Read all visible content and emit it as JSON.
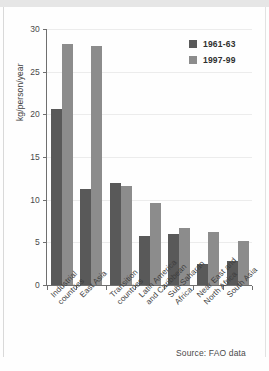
{
  "figure": {
    "source_note": "Source: FAO data",
    "background_color": "#fefefe"
  },
  "legend": {
    "position": "top-right",
    "entries": [
      {
        "label": "1961-63",
        "color": "#595959",
        "swatch_name": "legend-swatch-1961-63"
      },
      {
        "label": "1997-99",
        "color": "#8c8c8c",
        "swatch_name": "legend-swatch-1997-99"
      }
    ]
  },
  "axes": {
    "y_title": "kg/person/year",
    "y_ticks": [
      "0",
      "5",
      "10",
      "15",
      "20",
      "25",
      "30"
    ],
    "x_labels": [
      "Industrial\ncountries",
      "East Asia",
      "Transition\ncountries",
      "Latin America\nand Caribbean",
      "Sub-Saharan\nAfrica",
      "Near East and\nNorth Africa",
      "South Asia"
    ]
  },
  "chart_data": {
    "type": "bar",
    "title": "",
    "xlabel": "",
    "ylabel": "kg/person/year",
    "ylim": [
      0,
      30
    ],
    "yticks": [
      0,
      5,
      10,
      15,
      20,
      25,
      30
    ],
    "grid": true,
    "grid_axis": "y",
    "legend_position": "top-right",
    "categories": [
      "Industrial countries",
      "East Asia",
      "Transition countries",
      "Latin America and Caribbean",
      "Sub-Saharan Africa",
      "Near East and North Africa",
      "South Asia"
    ],
    "series": [
      {
        "name": "1961-63",
        "color": "#595959",
        "values": [
          20.6,
          11.2,
          12.0,
          5.8,
          6.0,
          2.5,
          2.8
        ]
      },
      {
        "name": "1997-99",
        "color": "#8c8c8c",
        "values": [
          28.2,
          28.0,
          11.6,
          9.6,
          6.7,
          6.2,
          5.2
        ]
      }
    ],
    "annotations": [
      "Source: FAO data"
    ]
  }
}
